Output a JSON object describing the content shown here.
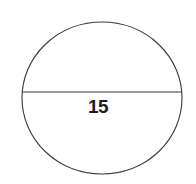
{
  "figure": {
    "type": "geometry-diagram",
    "background_color": "#ffffff",
    "stroke_color": "#3a3a3a",
    "stroke_width": 1,
    "text_color": "#1d1d1d",
    "circle": {
      "center_x": 102,
      "center_y": 98,
      "radius_x": 80,
      "radius_y": 76,
      "fill": "none"
    },
    "diameter": {
      "label": "15",
      "x1": 22,
      "y1": 92,
      "x2": 182,
      "y2": 92
    }
  }
}
